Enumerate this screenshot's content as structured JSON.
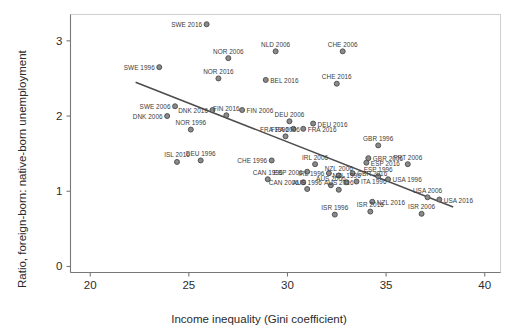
{
  "chart_data": {
    "type": "scatter",
    "title": "",
    "xlabel": "Income inequality (Gini coefficient)",
    "ylabel": "Ratio, foreign-born: native-born unemployment",
    "xlim": [
      19.0,
      40.8
    ],
    "ylim": [
      -0.08,
      3.35
    ],
    "xticks": [
      20,
      25,
      30,
      35,
      40
    ],
    "yticks": [
      0,
      1,
      2,
      3
    ],
    "grid": false,
    "legend": null,
    "marker_color": "#6e6e6e",
    "trendline": {
      "type": "linear-fit",
      "color": "#4d4d4d",
      "x_start": 22.3,
      "y_start": 2.45,
      "x_end": 38.4,
      "y_end": 0.79
    },
    "points": [
      {
        "label": "SWE 2016",
        "x": 25.9,
        "y": 3.22,
        "side": "r"
      },
      {
        "label": "NLD 2006",
        "x": 29.4,
        "y": 2.86,
        "side": "c"
      },
      {
        "label": "CHE 2006",
        "x": 32.8,
        "y": 2.86,
        "side": "c"
      },
      {
        "label": "NOR 2006",
        "x": 27.0,
        "y": 2.77,
        "side": "c"
      },
      {
        "label": "SWE 1996",
        "x": 23.5,
        "y": 2.65,
        "side": "r"
      },
      {
        "label": "NOR 2016",
        "x": 26.5,
        "y": 2.5,
        "side": "c"
      },
      {
        "label": "BEL 2016",
        "x": 28.9,
        "y": 2.48,
        "side": "l"
      },
      {
        "label": "CHE 2016",
        "x": 32.5,
        "y": 2.43,
        "side": "c"
      },
      {
        "label": "SWE 2006",
        "x": 24.3,
        "y": 2.13,
        "side": "r"
      },
      {
        "label": "DNK 2016",
        "x": 26.2,
        "y": 2.08,
        "side": "r"
      },
      {
        "label": "FIN 2006",
        "x": 27.7,
        "y": 2.08,
        "side": "l"
      },
      {
        "label": "DNK 2006",
        "x": 23.9,
        "y": 2.0,
        "side": "r"
      },
      {
        "label": "FIN 2016",
        "x": 26.9,
        "y": 2.01,
        "side": "c"
      },
      {
        "label": "DEU 2006",
        "x": 30.1,
        "y": 1.93,
        "side": "c"
      },
      {
        "label": "DEU 2016",
        "x": 31.3,
        "y": 1.9,
        "side": "l"
      },
      {
        "label": "FRA 2016",
        "x": 30.8,
        "y": 1.83,
        "side": "l"
      },
      {
        "label": "FRA 1996",
        "x": 30.3,
        "y": 1.83,
        "side": "r"
      },
      {
        "label": "NOR 1996",
        "x": 25.1,
        "y": 1.82,
        "side": "c"
      },
      {
        "label": "FRA 2006",
        "x": 29.9,
        "y": 1.73,
        "side": "c"
      },
      {
        "label": "GBR 1996",
        "x": 34.6,
        "y": 1.61,
        "side": "c"
      },
      {
        "label": "DEU 1996",
        "x": 25.6,
        "y": 1.41,
        "side": "c"
      },
      {
        "label": "CHE 1996",
        "x": 29.2,
        "y": 1.41,
        "side": "r"
      },
      {
        "label": "ISL 2016",
        "x": 24.4,
        "y": 1.39,
        "side": "c"
      },
      {
        "label": "GBR 2006",
        "x": 34.1,
        "y": 1.44,
        "side": "l"
      },
      {
        "label": "ESP 2016",
        "x": 34.0,
        "y": 1.38,
        "side": "l"
      },
      {
        "label": "IRL 2006",
        "x": 31.4,
        "y": 1.36,
        "side": "c"
      },
      {
        "label": "PRT 2006",
        "x": 36.1,
        "y": 1.36,
        "side": "c"
      },
      {
        "label": "CAN 1996",
        "x": 29.0,
        "y": 1.16,
        "side": "c"
      },
      {
        "label": "ESP 2006",
        "x": 31.0,
        "y": 1.26,
        "side": "r"
      },
      {
        "label": "IRL 1996",
        "x": 32.1,
        "y": 1.24,
        "side": "r"
      },
      {
        "label": "GBR 2016",
        "x": 33.3,
        "y": 1.24,
        "side": "l"
      },
      {
        "label": "NZL 2006",
        "x": 32.6,
        "y": 1.21,
        "side": "c"
      },
      {
        "label": "ESP 1996",
        "x": 34.6,
        "y": 1.2,
        "side": "c"
      },
      {
        "label": "USA 1996",
        "x": 35.1,
        "y": 1.16,
        "side": "l"
      },
      {
        "label": "CAN 2006",
        "x": 30.8,
        "y": 1.12,
        "side": "r"
      },
      {
        "label": "NZL 1996",
        "x": 33.0,
        "y": 1.12,
        "side": "c"
      },
      {
        "label": "ITA 1996",
        "x": 33.5,
        "y": 1.13,
        "side": "l"
      },
      {
        "label": "AUS 2006",
        "x": 32.2,
        "y": 1.08,
        "side": "c"
      },
      {
        "label": "AUS 1996",
        "x": 31.0,
        "y": 1.03,
        "side": "c"
      },
      {
        "label": "AUS 2016",
        "x": 32.6,
        "y": 1.02,
        "side": "c"
      },
      {
        "label": "USA 2006",
        "x": 37.1,
        "y": 0.92,
        "side": "c"
      },
      {
        "label": "USA 2016",
        "x": 37.7,
        "y": 0.89,
        "side": "l"
      },
      {
        "label": "NZL 2016",
        "x": 34.3,
        "y": 0.86,
        "side": "l"
      },
      {
        "label": "ISR 1996",
        "x": 32.4,
        "y": 0.69,
        "side": "c"
      },
      {
        "label": "ISR 2016",
        "x": 34.2,
        "y": 0.73,
        "side": "c"
      },
      {
        "label": "ISR 2006",
        "x": 36.8,
        "y": 0.7,
        "side": "c"
      }
    ]
  }
}
